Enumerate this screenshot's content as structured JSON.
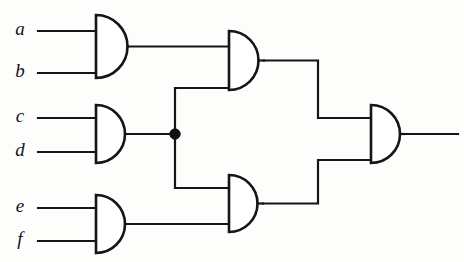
{
  "diagram": {
    "type": "logic-circuit",
    "background_color": "#fdfdfc",
    "line_color": "#151515",
    "width": 464,
    "height": 262
  },
  "inputs": [
    {
      "label": "a",
      "label_x": 20,
      "label_y": 31,
      "wire_y": 31,
      "wire_x1": 38,
      "wire_x2": 96
    },
    {
      "label": "b",
      "label_x": 20,
      "label_y": 73,
      "wire_y": 73,
      "wire_x1": 38,
      "wire_x2": 96
    },
    {
      "label": "c",
      "label_x": 20,
      "label_y": 118,
      "wire_y": 118,
      "wire_x1": 38,
      "wire_x2": 96
    },
    {
      "label": "d",
      "label_x": 20,
      "label_y": 152,
      "wire_y": 152,
      "wire_x1": 38,
      "wire_x2": 96
    },
    {
      "label": "e",
      "label_x": 20,
      "label_y": 208,
      "wire_y": 208,
      "wire_x1": 38,
      "wire_x2": 96
    },
    {
      "label": "f",
      "label_x": 20,
      "label_y": 241,
      "wire_y": 241,
      "wire_x1": 38,
      "wire_x2": 96
    }
  ],
  "gates": [
    {
      "id": "and-ab",
      "type": "AND",
      "x": 96,
      "y_top": 15,
      "y_bottom": 78,
      "out_x": 128,
      "out_y": 46.5
    },
    {
      "id": "and-cd",
      "type": "AND",
      "x": 96,
      "y_top": 105,
      "y_bottom": 163,
      "out_x": 126,
      "out_y": 134
    },
    {
      "id": "and-ef",
      "type": "AND",
      "x": 96,
      "y_top": 195,
      "y_bottom": 253,
      "out_x": 126,
      "out_y": 224
    },
    {
      "id": "and-upper",
      "type": "AND",
      "x": 229,
      "y_top": 31,
      "y_bottom": 90,
      "out_x": 264,
      "out_y": 60.5
    },
    {
      "id": "and-lower",
      "type": "AND",
      "x": 229,
      "y_top": 175,
      "y_bottom": 232,
      "out_x": 263,
      "out_y": 203.5
    },
    {
      "id": "and-final",
      "type": "AND",
      "x": 371,
      "y_top": 105,
      "y_bottom": 163,
      "out_x": 404,
      "out_y": 134
    }
  ],
  "wires": [
    {
      "name": "ab-out-to-upper-in1",
      "points": "128,46.5 229,46.5"
    },
    {
      "name": "cd-out-to-junction",
      "points": "126,134 175,134"
    },
    {
      "name": "junction-up-to-upper-in2",
      "points": "175,134 175,88 229,88"
    },
    {
      "name": "junction-down-to-lower-in1",
      "points": "175,134 175,188 229,188"
    },
    {
      "name": "ef-out-to-lower-in2",
      "points": "126,224 229,224"
    },
    {
      "name": "upper-out-to-final-in1",
      "points": "264,60.5 318,60.5 318,118 371,118"
    },
    {
      "name": "lower-out-to-final-in2",
      "points": "263,203.5 318,203.5 318,160 371,160"
    },
    {
      "name": "final-output",
      "points": "404,134 458,134"
    }
  ],
  "junctions": [
    {
      "name": "cd-fanout",
      "x": 175,
      "y": 134,
      "r": 5.2
    }
  ]
}
